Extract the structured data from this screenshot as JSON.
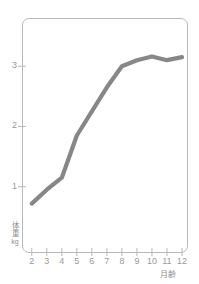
{
  "chart_data": {
    "type": "line",
    "title": "",
    "xlabel": "月齢",
    "ylabel": "体重",
    "yunit": "kg",
    "x": [
      2,
      3,
      4,
      5,
      6,
      7,
      8,
      9,
      10,
      11,
      12
    ],
    "values": [
      0.72,
      0.95,
      1.15,
      1.85,
      2.25,
      2.65,
      3.0,
      3.1,
      3.16,
      3.1,
      3.15
    ],
    "xtick_labels": [
      "2",
      "3",
      "4",
      "5",
      "6",
      "7",
      "8",
      "9",
      "10",
      "11",
      "12"
    ],
    "ytick_labels": [
      "1",
      "2",
      "3"
    ],
    "ytick_values": [
      1,
      2,
      3
    ],
    "xlim": [
      1.35,
      12.4
    ],
    "ylim": [
      -0.1,
      3.8
    ],
    "grid": false,
    "legend": null,
    "line_color": "#878787",
    "axis_color": "#b9b9b9",
    "tick_text_color": "#9a9a9a",
    "background": "#ffffff"
  },
  "axis": {
    "y_title_main": "体重",
    "y_title_unit": "kg",
    "x_title": "月齢"
  }
}
